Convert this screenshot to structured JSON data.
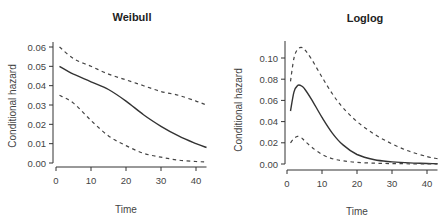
{
  "chart_data": [
    {
      "type": "line",
      "title": "Weibull",
      "xlabel": "Time",
      "ylabel": "Conditional hazard",
      "xlim": [
        0,
        43
      ],
      "ylim": [
        0,
        0.06
      ],
      "xticks": [
        0,
        10,
        20,
        30,
        40
      ],
      "xtick_labels": [
        "0",
        "10",
        "20",
        "30",
        "40"
      ],
      "yticks": [
        0.0,
        0.01,
        0.02,
        0.03,
        0.04,
        0.05,
        0.06
      ],
      "ytick_labels": [
        "0.00",
        "0.01",
        "0.02",
        "0.03",
        "0.04",
        "0.05",
        "0.06"
      ],
      "grid": false,
      "legend": null,
      "x": [
        1,
        5,
        10,
        15,
        20,
        25,
        30,
        35,
        40,
        43
      ],
      "series": [
        {
          "name": "estimate",
          "style": "solid",
          "values": [
            0.05,
            0.046,
            0.042,
            0.038,
            0.032,
            0.025,
            0.019,
            0.014,
            0.01,
            0.008
          ]
        },
        {
          "name": "upper 95% CI",
          "style": "dashed",
          "values": [
            0.06,
            0.054,
            0.05,
            0.046,
            0.043,
            0.04,
            0.037,
            0.035,
            0.032,
            0.03
          ]
        },
        {
          "name": "lower 95% CI",
          "style": "dashed",
          "values": [
            0.035,
            0.031,
            0.022,
            0.014,
            0.009,
            0.005,
            0.003,
            0.0015,
            0.0008,
            0.0005
          ]
        }
      ]
    },
    {
      "type": "line",
      "title": "Loglog",
      "xlabel": "Time",
      "ylabel": "Conditional hazard",
      "xlim": [
        0,
        43
      ],
      "ylim": [
        0,
        0.11
      ],
      "xticks": [
        0,
        10,
        20,
        30,
        40
      ],
      "xtick_labels": [
        "0",
        "10",
        "20",
        "30",
        "40"
      ],
      "yticks": [
        0.0,
        0.02,
        0.04,
        0.06,
        0.08,
        0.1
      ],
      "ytick_labels": [
        "0.00",
        "0.02",
        "0.04",
        "0.06",
        "0.08",
        "0.10"
      ],
      "grid": false,
      "legend": null,
      "x": [
        1,
        2,
        3,
        4,
        5,
        7,
        10,
        13,
        16,
        20,
        25,
        30,
        35,
        40,
        43
      ],
      "series": [
        {
          "name": "estimate",
          "style": "solid",
          "values": [
            0.05,
            0.068,
            0.074,
            0.074,
            0.071,
            0.061,
            0.044,
            0.029,
            0.018,
            0.009,
            0.004,
            0.002,
            0.001,
            0.0005,
            0.0003
          ]
        },
        {
          "name": "upper 95% CI",
          "style": "dashed",
          "values": [
            0.078,
            0.1,
            0.108,
            0.11,
            0.108,
            0.099,
            0.082,
            0.066,
            0.053,
            0.04,
            0.028,
            0.019,
            0.012,
            0.007,
            0.005
          ]
        },
        {
          "name": "lower 95% CI",
          "style": "dashed",
          "values": [
            0.02,
            0.024,
            0.026,
            0.025,
            0.022,
            0.016,
            0.009,
            0.005,
            0.003,
            0.0015,
            0.0008,
            0.0004,
            0.0002,
            0.0001,
            0.0001
          ]
        }
      ]
    }
  ]
}
